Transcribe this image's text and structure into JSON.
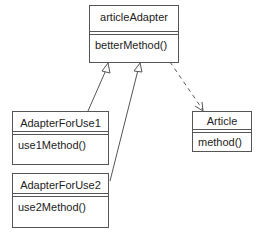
{
  "diagram": {
    "type": "UML class diagram",
    "classes": [
      {
        "id": "articleAdapter",
        "name": "articleAdapter",
        "methods": [
          "betterMethod()"
        ]
      },
      {
        "id": "AdapterForUse1",
        "name": "AdapterForUse1",
        "methods": [
          "use1Method()"
        ]
      },
      {
        "id": "AdapterForUse2",
        "name": "AdapterForUse2",
        "methods": [
          "use2Method()"
        ]
      },
      {
        "id": "Article",
        "name": "Article",
        "methods": [
          "method()"
        ]
      }
    ],
    "relationships": [
      {
        "from": "AdapterForUse1",
        "to": "articleAdapter",
        "kind": "generalization"
      },
      {
        "from": "AdapterForUse2",
        "to": "articleAdapter",
        "kind": "generalization"
      },
      {
        "from": "articleAdapter",
        "to": "Article",
        "kind": "dependency"
      }
    ],
    "colors": {
      "line": "#555555",
      "text": "#222222",
      "background": "#ffffff"
    }
  }
}
